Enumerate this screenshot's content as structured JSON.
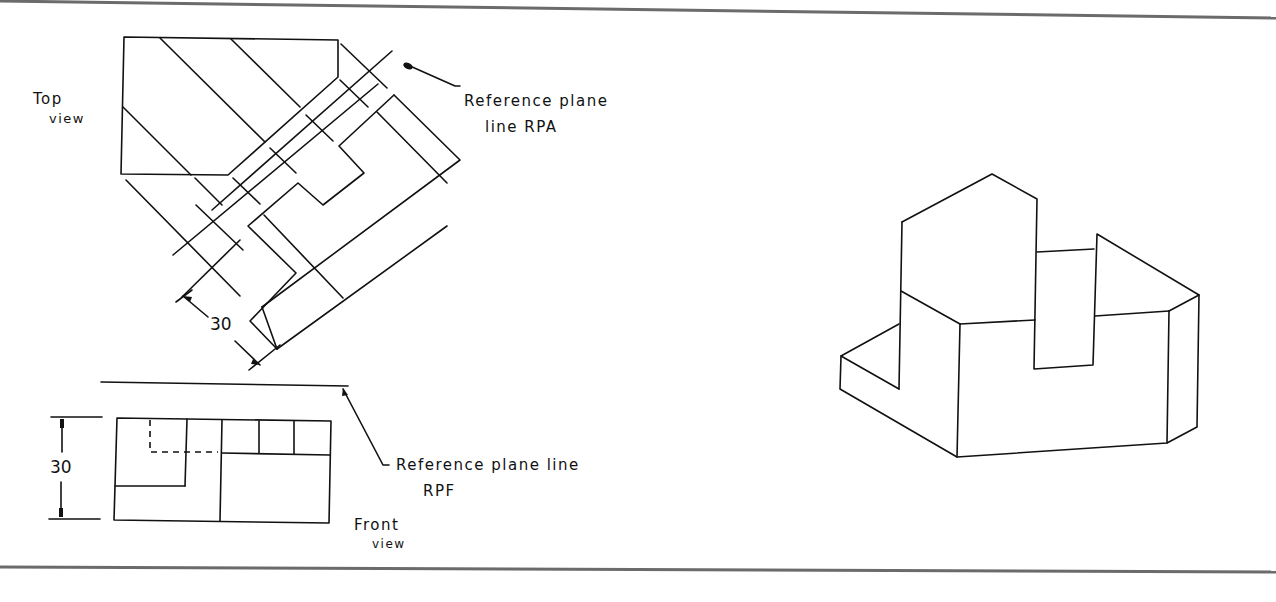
{
  "figure": {
    "top_view": {
      "label_line1": "Top",
      "label_line2": "view",
      "dimension": "30"
    },
    "front_view": {
      "label_line1": "Front",
      "label_line2": "view",
      "dimension": "30"
    },
    "callouts": {
      "rpa_line1": "Reference plane",
      "rpa_line2": "line RPA",
      "rpf_line1": "Reference plane line",
      "rpf_line2": "RPF"
    },
    "isometric_view": {
      "description": "Pictorial of the object"
    }
  }
}
